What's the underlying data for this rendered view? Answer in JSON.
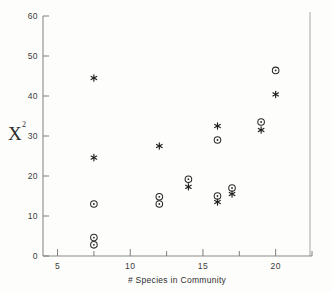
{
  "chart_data": {
    "type": "scatter",
    "title": "",
    "xlabel": "# Species in Community",
    "ylabel": "X²",
    "ylabel_base": "X",
    "ylabel_exponent": "2",
    "xlim": [
      4,
      22.5
    ],
    "ylim": [
      0,
      60
    ],
    "xticks": [
      5,
      10,
      15,
      20
    ],
    "xtick_labels": [
      "5",
      "10",
      "15",
      "20"
    ],
    "xminor_ticks": [
      7.5,
      12.5,
      17.5,
      22.5
    ],
    "yticks": [
      0,
      10,
      20,
      30,
      40,
      50,
      60
    ],
    "ytick_labels": [
      "0",
      "10",
      "20",
      "30",
      "40",
      "50",
      "60"
    ],
    "grid": false,
    "legend": "none",
    "series": [
      {
        "name": "circle",
        "marker": "open-circle-with-dot",
        "points": [
          {
            "x": 7.5,
            "y": 13.0
          },
          {
            "x": 7.5,
            "y": 4.6
          },
          {
            "x": 7.5,
            "y": 2.8
          },
          {
            "x": 12.0,
            "y": 14.8
          },
          {
            "x": 12.0,
            "y": 13.0
          },
          {
            "x": 14.0,
            "y": 19.2
          },
          {
            "x": 16.0,
            "y": 29.0
          },
          {
            "x": 16.0,
            "y": 15.0
          },
          {
            "x": 17.0,
            "y": 17.0
          },
          {
            "x": 19.0,
            "y": 33.5
          },
          {
            "x": 20.0,
            "y": 46.4
          }
        ]
      },
      {
        "name": "star",
        "marker": "asterisk",
        "points": [
          {
            "x": 7.5,
            "y": 44.5
          },
          {
            "x": 7.5,
            "y": 24.6
          },
          {
            "x": 12.0,
            "y": 27.5
          },
          {
            "x": 14.0,
            "y": 17.3
          },
          {
            "x": 16.0,
            "y": 32.5
          },
          {
            "x": 16.0,
            "y": 13.5
          },
          {
            "x": 17.0,
            "y": 15.5
          },
          {
            "x": 19.0,
            "y": 31.5
          },
          {
            "x": 20.0,
            "y": 40.4
          }
        ]
      }
    ]
  },
  "colors": {
    "axis": "#8a8a86",
    "frame": "#a8a8a4",
    "marker": "#2a2a2a",
    "text": "#2e2e2e",
    "background": "#fdfdfc"
  }
}
